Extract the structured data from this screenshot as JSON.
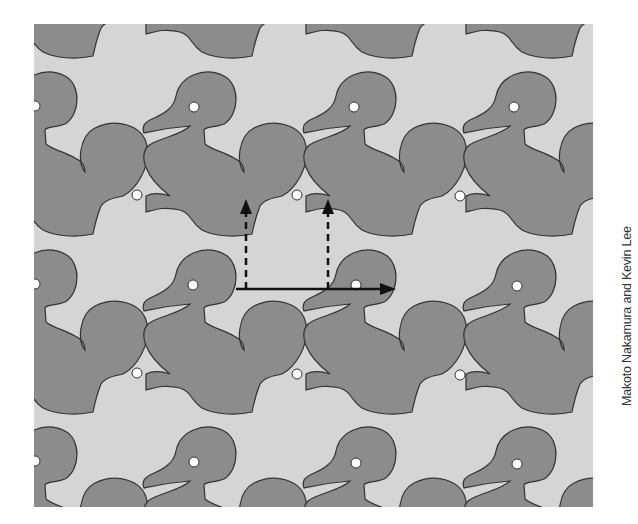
{
  "figure": {
    "colors": {
      "light_tile": "#d5d5d5",
      "dark_tile": "#8c8c8c",
      "outline": "#333333",
      "eye": "#ffffff",
      "arrow": "#111111"
    },
    "lattice": {
      "period_x": 160,
      "period_y": 178,
      "light_duck_offset": [
        -57,
        89
      ]
    },
    "arrows": [
      {
        "type": "solid",
        "from": [
          236,
          289
        ],
        "to": [
          395,
          289
        ],
        "label": "horizontal translation vector"
      },
      {
        "type": "dashed",
        "from": [
          246,
          289
        ],
        "to": [
          246,
          200
        ],
        "label": "vertical component A"
      },
      {
        "type": "dashed",
        "from": [
          328,
          289
        ],
        "to": [
          328,
          200
        ],
        "label": "vertical component B"
      }
    ]
  },
  "credit": "Makoto Nakamura and Kevin Lee"
}
